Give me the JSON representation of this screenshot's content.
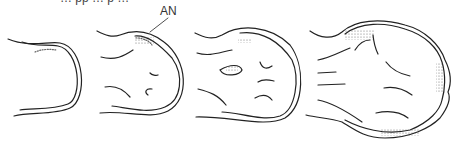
{
  "diagram": {
    "cut_off_caption": "… pp … p …",
    "labels": [
      {
        "text": "AN",
        "target": "stage-2 dense mesenchyme / anterior necrotic zone",
        "x": 130,
        "y": 14
      }
    ],
    "stages": [
      {
        "id": 1,
        "name": "early bud",
        "features": [
          "ectoderm outline",
          "stippled apical ridge"
        ]
      },
      {
        "id": 2,
        "name": "rounded bud",
        "features": [
          "ectoderm outline",
          "stippled region AN",
          "mesenchyme condensation lines"
        ]
      },
      {
        "id": 3,
        "name": "oval bud",
        "features": [
          "ectoderm outline",
          "stippled cluster",
          "radiating condensation lines"
        ]
      },
      {
        "id": 4,
        "name": "hand plate",
        "features": [
          "scalloped outline",
          "stippled margin",
          "digital ray lines"
        ]
      }
    ]
  },
  "colors": {
    "line": "#222222",
    "stipple": "#555555",
    "background": "#ffffff"
  }
}
